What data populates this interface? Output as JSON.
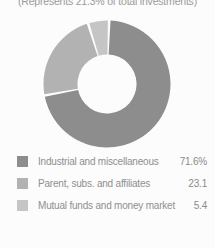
{
  "caption": "(Represents 21.3% of total investments)",
  "chart_data": {
    "type": "pie",
    "donut": true,
    "title": "(Represents 21.3% of total investments)",
    "categories": [
      "Industrial and miscellaneous",
      "Parent, subs. and affiliates",
      "Mutual funds and money market"
    ],
    "values": [
      71.6,
      23.1,
      5.4
    ],
    "value_labels": [
      "71.6%",
      "23.1",
      "5.4"
    ],
    "colors": [
      "#8d8d8d",
      "#b2b2b2",
      "#c5c5c5"
    ],
    "legend_position": "bottom",
    "start_angle_deg": 2,
    "direction": "clockwise",
    "gap_deg": 2.4,
    "inner_radius_ratio": 0.465
  }
}
